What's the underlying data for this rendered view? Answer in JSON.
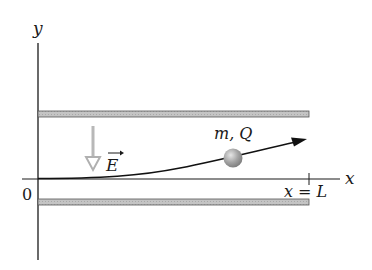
{
  "diagram": {
    "labels": {
      "y_axis": "y",
      "x_axis": "x",
      "origin": "0",
      "field": "E",
      "particle": "m, Q",
      "plate_end": "x = L"
    },
    "colors": {
      "axis": "#1a1a1a",
      "plate_fill": "#bdbdbd",
      "plate_edge": "#555555",
      "field_arrow": "#b5b5b5",
      "trajectory": "#111111",
      "particle": "#9a9a9a"
    }
  }
}
